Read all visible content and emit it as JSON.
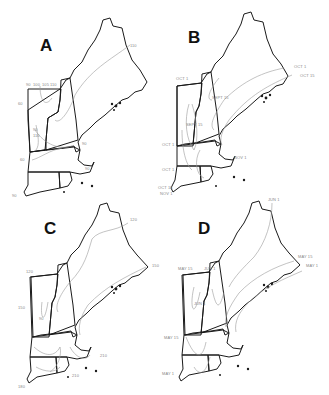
{
  "figure": {
    "panels": [
      {
        "id": "A",
        "letter": "A",
        "labels": [
          "90",
          "100",
          "105",
          "110",
          "60",
          "110",
          "90",
          "110",
          "60",
          "90",
          "90",
          "90"
        ]
      },
      {
        "id": "B",
        "letter": "B",
        "labels": [
          "OCT 1",
          "OCT 15",
          "OCT 1",
          "SEPT 15",
          "SEPT 15",
          "OCT 1",
          "OCT 1",
          "NOV 1",
          "OCT 15",
          "NOV 1"
        ]
      },
      {
        "id": "C",
        "letter": "C",
        "labels": [
          "120",
          "150",
          "120",
          "150",
          "90",
          "210",
          "210",
          "180"
        ]
      },
      {
        "id": "D",
        "letter": "D",
        "labels": [
          "JUN 1",
          "MAY 15",
          "MAY 1",
          "MAY 15",
          "JUN 1",
          "JUN 1",
          "MAY 15",
          "MAY 1"
        ]
      }
    ],
    "colors": {
      "outline": "#1a1a1a",
      "isoline": "#9a9a9a",
      "label": "#888888"
    }
  }
}
